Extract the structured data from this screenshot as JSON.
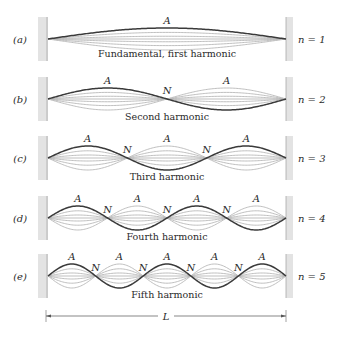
{
  "figure": {
    "string": {
      "x_start": 48,
      "x_end": 286
    },
    "colors": {
      "dark": "#3a3a3a",
      "light": "#b8b8b8",
      "wall": "#e3e3e3",
      "wall_line": "#a8a8a8",
      "text": "#2a2a2a"
    },
    "antinode_label": "A",
    "node_label": "N",
    "rows": [
      {
        "label": "(a)",
        "n": 1,
        "n_text": "n = 1",
        "caption": "Fundamental, first harmonic",
        "cy": 39,
        "amp": 11,
        "caption_y": 57
      },
      {
        "label": "(b)",
        "n": 2,
        "n_text": "n = 2",
        "caption": "Second harmonic",
        "cy": 99,
        "amp": 11,
        "caption_y": 120
      },
      {
        "label": "(c)",
        "n": 3,
        "n_text": "n = 3",
        "caption": "Third harmonic",
        "cy": 158,
        "amp": 12,
        "caption_y": 180
      },
      {
        "label": "(d)",
        "n": 4,
        "n_text": "n = 4",
        "caption": "Fourth harmonic",
        "cy": 218,
        "amp": 12,
        "caption_y": 240
      },
      {
        "label": "(e)",
        "n": 5,
        "n_text": "n = 5",
        "caption": "Fifth harmonic",
        "cy": 276,
        "amp": 12,
        "caption_y": 298
      }
    ],
    "length_marker": {
      "label": "L",
      "y": 316,
      "x1": 46,
      "x2": 286
    }
  }
}
